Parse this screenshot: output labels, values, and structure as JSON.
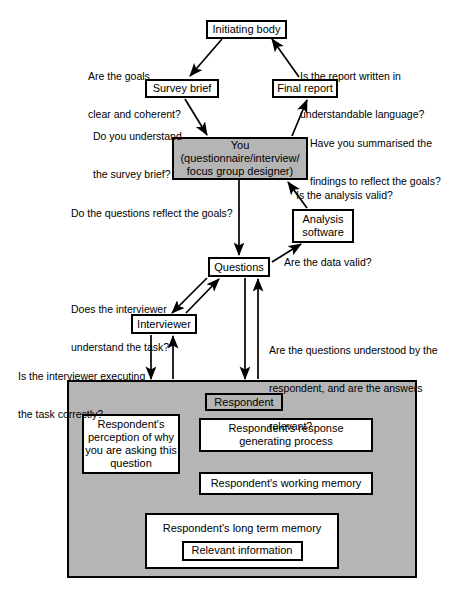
{
  "diagram": {
    "colors": {
      "panel_fill": "#b5b5b5",
      "box_fill": "#ffffff",
      "stroke": "#000000"
    },
    "nodes": {
      "initiating_body": "Initiating body",
      "survey_brief": "Survey brief",
      "final_report": "Final report",
      "you_line1": "You",
      "you_line2": "(questionnaire/interview/",
      "you_line3": "focus group designer)",
      "analysis_software_line1": "Analysis",
      "analysis_software_line2": "software",
      "questions": "Questions",
      "interviewer": "Interviewer",
      "respondent": "Respondent",
      "response_process_line1": "Respondent's response",
      "response_process_line2": "generating process",
      "working_memory": "Respondent's working memory",
      "long_term_memory": "Respondent's long term memory",
      "relevant_information": "Relevant information",
      "perception_line1": "Respondent's",
      "perception_line2": "perception of why",
      "perception_line3": "you are asking this",
      "perception_line4": "question"
    },
    "labels": {
      "goals_clear_line1": "Are the goals",
      "goals_clear_line2": "clear and coherent?",
      "report_written_line1": "Is the report written in",
      "report_written_line2": "understandable language?",
      "understand_brief_line1": "Do you understand",
      "understand_brief_line2": "the survey brief?",
      "summarised_line1": "Have you summarised the",
      "summarised_line2": "findings to reflect the goals?",
      "analysis_valid": "Is the analysis valid?",
      "questions_reflect_goals": "Do the questions reflect the goals?",
      "data_valid": "Are the data valid?",
      "interviewer_task_line1": "Does the interviewer",
      "interviewer_task_line2": "understand the task?",
      "executing_task_line1": "Is the interviewer executing",
      "executing_task_line2": "the task correctly?",
      "questions_understood_line1": "Are the questions understood by the",
      "questions_understood_line2": "respondent, and are the answers",
      "questions_understood_line3": "relevant?"
    }
  }
}
